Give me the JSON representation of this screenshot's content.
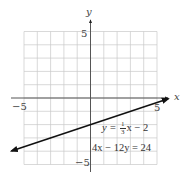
{
  "chart_data": {
    "type": "line",
    "title": "",
    "xlabel": "x",
    "ylabel": "y",
    "xlim": [
      -6,
      6
    ],
    "ylim": [
      -6,
      6
    ],
    "grid": true,
    "grid_step": 1,
    "tick_labels": {
      "x": [
        "-5",
        "5"
      ],
      "y": [
        "5",
        "-5"
      ]
    },
    "series": [
      {
        "name": "y = (1/3)x - 2",
        "equation": "4x - 12y = 24",
        "slope": 0.3333,
        "intercept": -2,
        "x": [
          -6,
          0,
          6
        ],
        "y": [
          -4,
          -2,
          0
        ],
        "arrows": "both"
      }
    ],
    "annotations": [
      "y = (1/3)x − 2",
      "4x − 12y = 24"
    ],
    "line_color": "#111111",
    "grid_color": "#c8c8c8",
    "axis_color": "#555555"
  },
  "labels": {
    "x_axis": "x",
    "y_axis": "y",
    "x_neg": "−5",
    "x_pos": "5",
    "y_pos": "5",
    "y_neg": "−5",
    "eq1_lhs": "y = ",
    "eq1_num": "1",
    "eq1_den": "3",
    "eq1_rhs": "x − 2",
    "eq2": "4x − 12y = 24"
  }
}
